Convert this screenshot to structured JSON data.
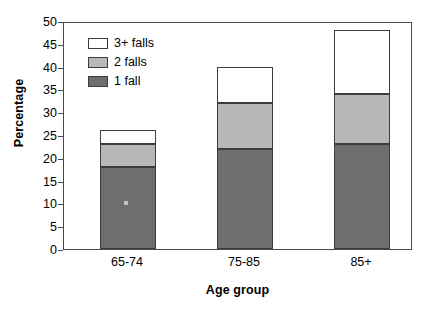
{
  "chart_data": {
    "type": "bar",
    "subtype": "stacked-bar",
    "title": "",
    "xlabel": "Age group",
    "ylabel": "Percentage",
    "categories": [
      "65-74",
      "75-85",
      "85+"
    ],
    "series": [
      {
        "name": "1 fall",
        "values": [
          18,
          22,
          23
        ],
        "color": "#6e6e6e"
      },
      {
        "name": "2 falls",
        "values": [
          5,
          10,
          11
        ],
        "color": "#b8b8b8"
      },
      {
        "name": "3+ falls",
        "values": [
          3,
          8,
          14
        ],
        "color": "#ffffff"
      }
    ],
    "cumulative_tops": [
      {
        "category": "65-74",
        "one_fall_top": 18,
        "two_falls_top": 23,
        "three_plus_top": 26
      },
      {
        "category": "75-85",
        "one_fall_top": 22,
        "two_falls_top": 32,
        "three_plus_top": 40
      },
      {
        "category": "85+",
        "one_fall_top": 23,
        "two_falls_top": 34,
        "three_plus_top": 48
      }
    ],
    "totals": [
      26,
      40,
      48
    ],
    "ylim": [
      0,
      50
    ],
    "ytick_step": 5,
    "yticks": [
      0,
      5,
      10,
      15,
      20,
      25,
      30,
      35,
      40,
      45,
      50
    ],
    "ytick_labels": [
      "0",
      "5",
      "10",
      "15",
      "20",
      "25",
      "30",
      "35",
      "40",
      "45",
      "50"
    ],
    "grid": false,
    "legend_position": "top-left",
    "legend_order": [
      "3+ falls",
      "2 falls",
      "1 fall"
    ],
    "frame_color": "#4a4a4a",
    "bar_edge_color": "#3c3c3c",
    "background": "#ffffff"
  },
  "axes": {
    "y_title": "Percentage",
    "x_title": "Age group"
  },
  "legend": {
    "items": [
      {
        "label": "3+ falls",
        "color": "#ffffff"
      },
      {
        "label": "2 falls",
        "color": "#b8b8b8"
      },
      {
        "label": "1 fall",
        "color": "#6e6e6e"
      }
    ]
  }
}
